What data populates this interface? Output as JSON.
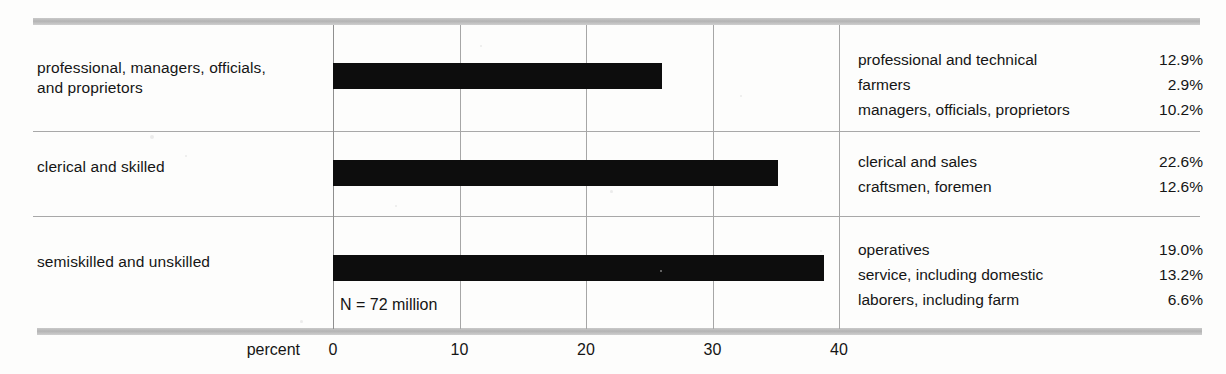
{
  "chart_data": {
    "type": "bar",
    "title": "",
    "xlabel": "percent",
    "ylabel": "",
    "orientation": "horizontal",
    "xlim": [
      0,
      43
    ],
    "xticks": [
      0,
      10,
      20,
      30,
      40
    ],
    "xtick_labels": [
      "0",
      "10",
      "20",
      "30",
      "40"
    ],
    "grid": true,
    "annotation": "N = 72 million",
    "categories": [
      "professional, managers, officials, and proprietors",
      "clerical and skilled",
      "semiskilled and unskilled"
    ],
    "values": [
      26.0,
      35.2,
      38.8
    ],
    "breakdown": [
      {
        "category": "professional, managers, officials, and proprietors",
        "items": [
          {
            "name": "professional and technical",
            "value": "12.9%"
          },
          {
            "name": "farmers",
            "value": "2.9%"
          },
          {
            "name": "managers, officials, proprietors",
            "value": "10.2%"
          }
        ]
      },
      {
        "category": "clerical and skilled",
        "items": [
          {
            "name": "clerical and sales",
            "value": "22.6%"
          },
          {
            "name": "craftsmen, foremen",
            "value": "12.6%"
          }
        ]
      },
      {
        "category": "semiskilled and unskilled",
        "items": [
          {
            "name": "operatives",
            "value": "19.0%"
          },
          {
            "name": "service, including domestic",
            "value": "13.2%"
          },
          {
            "name": "laborers, including farm",
            "value": "6.6%"
          }
        ]
      }
    ],
    "colors": {
      "bar": "#0d0d0d",
      "grid": "#a6a6a6",
      "rule": "#a8a8a8",
      "band": "#b4b4b4",
      "text": "#151515",
      "background": "#fdfdfc"
    }
  },
  "rows": [
    {
      "label_line1": "professional, managers, officials,",
      "label_line2": "and proprietors"
    },
    {
      "label_line1": "clerical and skilled",
      "label_line2": ""
    },
    {
      "label_line1": "semiskilled and unskilled",
      "label_line2": ""
    }
  ]
}
